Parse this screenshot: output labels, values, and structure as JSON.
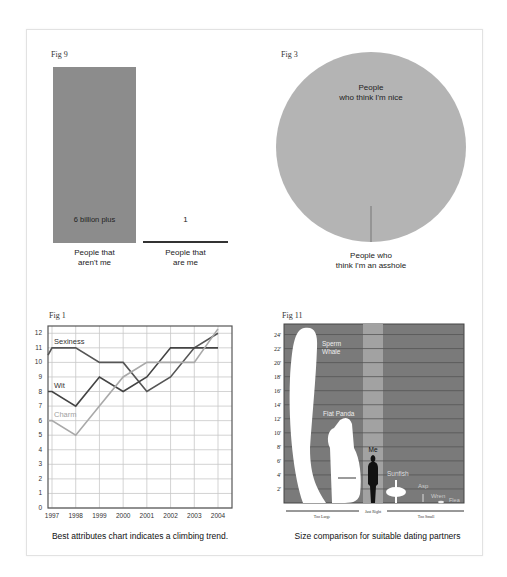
{
  "colors": {
    "bar": "#8c8c8c",
    "pie": "#b4b4b4",
    "line_sexiness": "#555555",
    "line_wit": "#444444",
    "line_charm": "#a9a9a9",
    "size_bg": "#7a7a7a",
    "size_band": "#a2a2a2"
  },
  "figures": {
    "fig9": {
      "label": "Fig 9",
      "bar_value_label": "6 billion plus",
      "other_value_label": "1",
      "category_a": [
        "People that",
        "aren't me"
      ],
      "category_b": [
        "People that",
        "are me"
      ]
    },
    "fig3": {
      "label": "Fig 3",
      "slice_major": [
        "People",
        "who think I'm nice"
      ],
      "slice_minor": [
        "People who",
        "think I'm an asshole"
      ]
    },
    "fig1": {
      "label": "Fig 1",
      "caption": "Best attributes chart indicates a climbing trend.",
      "series_labels": {
        "sexiness": "Sexiness",
        "wit": "Wit",
        "charm": "Charm"
      }
    },
    "fig11": {
      "label": "Fig 11",
      "caption": "Size comparison for suitable dating partners",
      "items": {
        "whale": [
          "Sperm",
          "Whale"
        ],
        "panda": "Fiat Panda",
        "me": "Me",
        "sunfish": "Sunfish",
        "asp": "Asp",
        "wren": "Wren",
        "flea": "Flea"
      },
      "zones": {
        "too_large": "Too Large",
        "just_right": "Just Right",
        "too_small": "Too Small"
      }
    }
  },
  "chart_data": [
    {
      "type": "bar",
      "title": "Fig 9",
      "categories": [
        "People that aren't me",
        "People that are me"
      ],
      "values": [
        6000000000,
        1
      ],
      "data_labels": [
        "6 billion plus",
        "1"
      ],
      "xlabel": "",
      "ylabel": ""
    },
    {
      "type": "pie",
      "title": "Fig 3",
      "labels": [
        "People who think I'm nice",
        "People who think I'm an asshole"
      ],
      "values": [
        99.9,
        0.1
      ]
    },
    {
      "type": "line",
      "title": "Fig 1",
      "caption": "Best attributes chart indicates a climbing trend.",
      "x": [
        1997,
        1998,
        1999,
        2000,
        2001,
        2002,
        2003,
        2004
      ],
      "series": [
        {
          "name": "Sexiness",
          "values": [
            11,
            11,
            10,
            10,
            8,
            9,
            11,
            12
          ]
        },
        {
          "name": "Wit",
          "values": [
            8,
            7,
            9,
            8,
            9,
            11,
            11,
            11
          ]
        },
        {
          "name": "Charm",
          "values": [
            6,
            5,
            7,
            9,
            10,
            10,
            10,
            12.3
          ]
        }
      ],
      "ylim": [
        0,
        12
      ],
      "yticks": [
        0,
        1,
        2,
        3,
        4,
        5,
        6,
        7,
        8,
        9,
        10,
        11,
        12
      ],
      "grid": true,
      "legend": "inline labels"
    },
    {
      "type": "bar",
      "title": "Fig 11",
      "caption": "Size comparison for suitable dating partners",
      "categories": [
        "Sperm Whale",
        "Fiat Panda",
        "Me",
        "Sunfish",
        "Asp",
        "Wren",
        "Flea"
      ],
      "values": [
        25,
        11.5,
        6,
        4.5,
        3,
        0.5,
        0.1
      ],
      "ylabel": "Height (ft)",
      "yticks": [
        "2'",
        "4'",
        "6'",
        "8'",
        "10'",
        "12'",
        "14'",
        "16'",
        "18'",
        "20'",
        "22'",
        "24'"
      ],
      "zones": [
        "Too Large",
        "Just Right",
        "Too Small"
      ]
    }
  ]
}
